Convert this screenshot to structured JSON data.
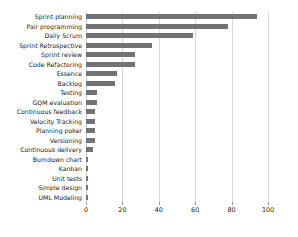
{
  "chart_data": {
    "type": "bar",
    "orientation": "horizontal",
    "title": "",
    "xlabel": "",
    "ylabel": "",
    "xlim": [
      0,
      100
    ],
    "xticks": [
      0,
      20,
      40,
      60,
      80,
      100
    ],
    "xtick_labels": [
      "0",
      "20",
      "40",
      "60",
      "80",
      "100"
    ],
    "grid": true,
    "grid_axis": "x",
    "legend": null,
    "bar_color": "#737373",
    "categories": [
      "Sprint planning",
      "Pair programming",
      "Daily Scrum",
      "Sprint Retrospective",
      "Sprint review",
      "Code Refactoring",
      "Essence",
      "Backlog",
      "Testing",
      "GQM evaluation",
      "Continuous feedback",
      "Velocity Tracking",
      "Planning poker",
      "Versioning",
      "Continuous delivery",
      "Burndown chart",
      "Kanban",
      "Unit tests",
      "Simple design",
      "UML Modeling"
    ],
    "values": [
      94,
      78,
      59,
      36,
      27,
      27,
      17,
      16,
      6,
      6,
      5,
      5,
      5,
      5,
      4,
      1,
      1,
      1,
      1,
      1
    ]
  }
}
